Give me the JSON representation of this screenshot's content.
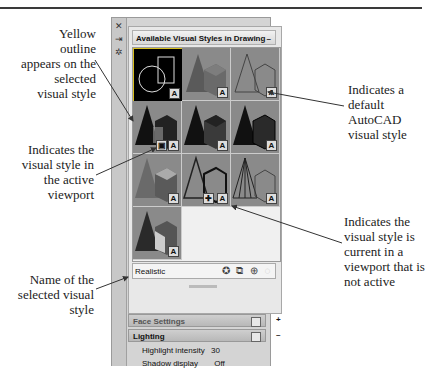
{
  "palette": {
    "title": "Available Visual Styles in Drawing",
    "minimize_symbol": "–",
    "strip_icons": [
      "close-icon",
      "auto-hide-icon",
      "properties-icon"
    ],
    "thumbnails": [
      {
        "name": "2D Wireframe",
        "selected": true,
        "default_badge": "A"
      },
      {
        "name": "Conceptual",
        "selected": false,
        "default_badge": "A"
      },
      {
        "name": "Hidden",
        "selected": false,
        "default_badge": "A"
      },
      {
        "name": "Realistic (active viewport)",
        "selected": false,
        "default_badge": "A"
      },
      {
        "name": "Shaded",
        "selected": false,
        "default_badge": "A"
      },
      {
        "name": "Shaded with edges",
        "selected": false,
        "default_badge": "A"
      },
      {
        "name": "Shades of Gray",
        "selected": false,
        "default_badge": "A"
      },
      {
        "name": "Sketchy",
        "selected": false,
        "default_badge": "A"
      },
      {
        "name": "Wireframe",
        "selected": false,
        "default_badge": "A"
      },
      {
        "name": "X-Ray",
        "selected": false,
        "default_badge": "A"
      }
    ],
    "selected_name": "Realistic",
    "tool_icons": [
      "create-visual-style-icon",
      "apply-to-viewport-icon",
      "export-to-tool-palette-icon",
      "delete-visual-style-icon"
    ]
  },
  "sections": [
    {
      "label": "Face Settings",
      "expanded": false,
      "toggle": "+"
    },
    {
      "label": "Lighting",
      "expanded": true,
      "toggle": "–"
    }
  ],
  "properties": [
    {
      "label": "Highlight intensity",
      "value": "30"
    },
    {
      "label": "Shadow display",
      "value": "Off"
    }
  ],
  "callouts": {
    "yellow_outline": "Yellow outline appears on the selected visual style",
    "active_viewport": "Indicates the visual style in the active viewport",
    "name_selected": "Name of the selected visual style",
    "default_style": "Indicates a default AutoCAD visual style",
    "current_not_active": "Indicates the visual style is current in a viewport that is not active"
  },
  "colors": {
    "selection_outline": "#d8c020",
    "panel_bg": "#d4d4d4"
  }
}
